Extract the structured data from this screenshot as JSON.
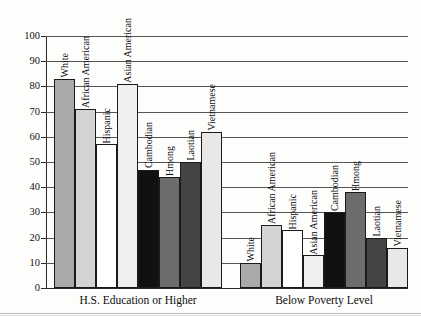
{
  "chart_data": {
    "type": "bar",
    "title": "",
    "xlabel": "",
    "ylabel": "",
    "ylim": [
      0,
      100
    ],
    "yticks": [
      0,
      10,
      20,
      30,
      40,
      50,
      60,
      70,
      80,
      90,
      100
    ],
    "grid": true,
    "legend": "none",
    "groups": [
      {
        "label": "H.S. Education or Higher",
        "categories": [
          "White",
          "African American",
          "Hispanic",
          "Asian American",
          "Cambodian",
          "Hmong",
          "Laotian",
          "Vietnamese"
        ],
        "values": [
          83,
          71,
          57,
          81,
          47,
          44,
          50,
          62
        ]
      },
      {
        "label": "Below Poverty Level",
        "categories": [
          "White",
          "African American",
          "Hispanic",
          "Asian American",
          "Cambodian",
          "Hmong",
          "Laotian",
          "Vietnamese"
        ],
        "values": [
          10,
          25,
          23,
          13,
          30,
          38,
          20,
          16
        ]
      }
    ],
    "series_colors": {
      "White": "#a9a9a9",
      "African American": "#d4d4d4",
      "Hispanic": "#ffffff",
      "Asian American": "#efefef",
      "Cambodian": "#111111",
      "Hmong": "#6d6d6d",
      "Laotian": "#444444",
      "Vietnamese": "#e8e8e8"
    }
  }
}
